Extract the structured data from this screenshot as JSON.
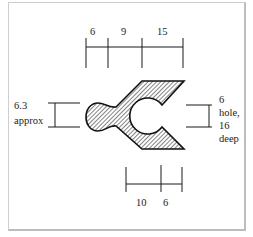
{
  "diagram": {
    "type": "engineering-profile-drawing",
    "colors": {
      "line": "#1a1a1a",
      "hatch": "#333333",
      "background": "#ffffff",
      "frame": "#c8c8c8"
    },
    "top_dimension": {
      "labels": [
        "6",
        "9",
        "15"
      ]
    },
    "bottom_dimension": {
      "labels": [
        "10",
        "6"
      ]
    },
    "left_dimension": {
      "value": "6.3",
      "note": "approx"
    },
    "right_dimension": {
      "lines": [
        "6",
        "hole,",
        "16",
        "deep"
      ]
    }
  }
}
